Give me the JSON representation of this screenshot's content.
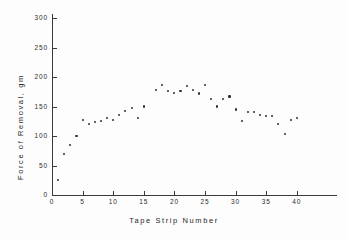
{
  "chart_data": {
    "type": "scatter",
    "title": "",
    "xlabel": "Tape Strip Number",
    "ylabel": "Force of Removal, gm",
    "xlim": [
      0,
      46.5
    ],
    "ylim": [
      0,
      311
    ],
    "grid": false,
    "legend": null,
    "xticks": [
      0,
      5,
      10,
      15,
      20,
      25,
      30,
      35,
      40
    ],
    "xtick_labels": [
      "0",
      "5",
      "10",
      "15",
      "20",
      "25",
      "30",
      "35",
      "40"
    ],
    "yticks": [
      0,
      50,
      100,
      150,
      200,
      250,
      300
    ],
    "ytick_labels": [
      "0",
      "50",
      "100",
      "150",
      "200",
      "250",
      "300"
    ],
    "marker": "square-dot",
    "marker_color": "#303030",
    "axis_color": "#3a3a3a",
    "background_color": "#fdfdfd",
    "x": [
      1,
      2,
      3,
      4,
      5,
      6,
      7,
      8,
      9,
      10,
      11,
      12,
      13,
      14,
      15,
      17,
      18,
      19,
      20,
      21,
      22,
      23,
      24,
      25,
      26,
      27,
      28,
      29,
      30,
      31,
      32,
      33,
      34,
      35,
      36,
      37,
      38,
      39,
      40
    ],
    "values": [
      25,
      70,
      85,
      100,
      127,
      121,
      124,
      126,
      130,
      127,
      135,
      143,
      148,
      130,
      150,
      178,
      187,
      176,
      173,
      177,
      185,
      178,
      172,
      187,
      162,
      150,
      163,
      167,
      145,
      125,
      141,
      140,
      135,
      134,
      134,
      120,
      104,
      127,
      130
    ],
    "points": [
      {
        "x": 1,
        "y": 25
      },
      {
        "x": 2,
        "y": 70
      },
      {
        "x": 3,
        "y": 85
      },
      {
        "x": 4,
        "y": 100
      },
      {
        "x": 5,
        "y": 127
      },
      {
        "x": 6,
        "y": 121
      },
      {
        "x": 7,
        "y": 124
      },
      {
        "x": 8,
        "y": 126
      },
      {
        "x": 9,
        "y": 130
      },
      {
        "x": 10,
        "y": 127
      },
      {
        "x": 11,
        "y": 135
      },
      {
        "x": 12,
        "y": 143
      },
      {
        "x": 13,
        "y": 148
      },
      {
        "x": 14,
        "y": 130
      },
      {
        "x": 15,
        "y": 150
      },
      {
        "x": 17,
        "y": 178
      },
      {
        "x": 18,
        "y": 187
      },
      {
        "x": 19,
        "y": 176
      },
      {
        "x": 20,
        "y": 173
      },
      {
        "x": 21,
        "y": 177
      },
      {
        "x": 22,
        "y": 185
      },
      {
        "x": 23,
        "y": 178
      },
      {
        "x": 24,
        "y": 172
      },
      {
        "x": 25,
        "y": 187
      },
      {
        "x": 26,
        "y": 162
      },
      {
        "x": 27,
        "y": 150
      },
      {
        "x": 28,
        "y": 163
      },
      {
        "x": 29,
        "y": 167
      },
      {
        "x": 30,
        "y": 145
      },
      {
        "x": 31,
        "y": 125
      },
      {
        "x": 32,
        "y": 141
      },
      {
        "x": 33,
        "y": 140
      },
      {
        "x": 34,
        "y": 135
      },
      {
        "x": 35,
        "y": 134
      },
      {
        "x": 36,
        "y": 134
      },
      {
        "x": 37,
        "y": 120
      },
      {
        "x": 38,
        "y": 104
      },
      {
        "x": 39,
        "y": 127
      },
      {
        "x": 40,
        "y": 130
      }
    ]
  }
}
